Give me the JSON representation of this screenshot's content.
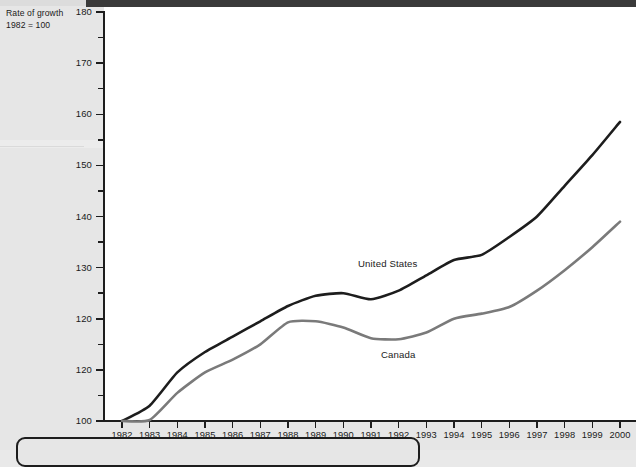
{
  "axis_caption": {
    "line1": "Rate of growth",
    "line2": "1982 = 100"
  },
  "series_labels": {
    "united_states": "United States",
    "canada": "Canada"
  },
  "colors": {
    "united_states": "#1d1d1d",
    "canada": "#7a7a7a",
    "axis": "#1d1d1d",
    "plot_background": "#ffffff",
    "page_background": "#e6e6e6"
  },
  "chart_data": {
    "type": "line",
    "title": "",
    "subtitle": "",
    "xlabel": "",
    "ylabel": "Rate of growth, 1982 = 100",
    "xlim": [
      1982,
      2000
    ],
    "ylim": [
      100,
      180
    ],
    "ytick_step": 10,
    "yminor_tick_step": 5,
    "grid": false,
    "legend_position": "inline-annotation",
    "categories": [
      "1982",
      "1983",
      "1984",
      "1985",
      "1986",
      "1987",
      "1988",
      "1989",
      "1990",
      "1991",
      "1992",
      "1993",
      "1994",
      "1995",
      "1996",
      "1997",
      "1998",
      "1999",
      "2000"
    ],
    "x": [
      1982,
      1983,
      1984,
      1985,
      1986,
      1987,
      1988,
      1989,
      1990,
      1991,
      1992,
      1993,
      1994,
      1995,
      1996,
      1997,
      1998,
      1999,
      2000
    ],
    "ytick_labels": [
      "100",
      "120",
      "120",
      "130",
      "140",
      "150",
      "160",
      "170",
      "180"
    ],
    "ytick_values": [
      100,
      110,
      120,
      130,
      140,
      150,
      160,
      170,
      180
    ],
    "series": [
      {
        "name": "United States",
        "color": "#1d1d1d",
        "values": [
          100.0,
          103.0,
          109.5,
          113.5,
          116.5,
          119.5,
          122.5,
          124.5,
          125.0,
          123.8,
          125.5,
          128.5,
          131.5,
          132.5,
          136.0,
          140.0,
          146.0,
          152.0,
          158.5
        ]
      },
      {
        "name": "Canada",
        "color": "#7a7a7a",
        "values": [
          100.0,
          100.2,
          105.5,
          109.5,
          112.0,
          115.0,
          119.3,
          119.5,
          118.3,
          116.2,
          116.0,
          117.3,
          120.0,
          121.0,
          122.3,
          125.5,
          129.5,
          134.0,
          139.0
        ]
      }
    ]
  }
}
